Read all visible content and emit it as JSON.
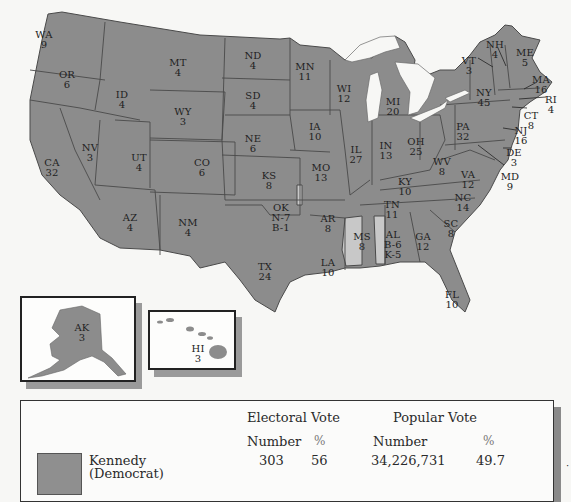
{
  "map": {
    "colors": {
      "kennedy": "#8c8c8c",
      "unpledged_byrd": "#c8c8c8",
      "border": "#4a4a4a",
      "water": "#f7f7f5"
    },
    "states": [
      {
        "abbr": "WA",
        "ev": "9",
        "x": 44,
        "y": 30
      },
      {
        "abbr": "OR",
        "ev": "6",
        "x": 67,
        "y": 70
      },
      {
        "abbr": "CA",
        "ev": "32",
        "x": 52,
        "y": 158
      },
      {
        "abbr": "NV",
        "ev": "3",
        "x": 90,
        "y": 143
      },
      {
        "abbr": "ID",
        "ev": "4",
        "x": 122,
        "y": 90
      },
      {
        "abbr": "MT",
        "ev": "4",
        "x": 178,
        "y": 58
      },
      {
        "abbr": "WY",
        "ev": "3",
        "x": 183,
        "y": 107
      },
      {
        "abbr": "UT",
        "ev": "4",
        "x": 139,
        "y": 153
      },
      {
        "abbr": "CO",
        "ev": "6",
        "x": 202,
        "y": 158
      },
      {
        "abbr": "AZ",
        "ev": "4",
        "x": 130,
        "y": 213
      },
      {
        "abbr": "NM",
        "ev": "4",
        "x": 188,
        "y": 218
      },
      {
        "abbr": "ND",
        "ev": "4",
        "x": 253,
        "y": 51
      },
      {
        "abbr": "SD",
        "ev": "4",
        "x": 253,
        "y": 91
      },
      {
        "abbr": "NE",
        "ev": "6",
        "x": 253,
        "y": 134
      },
      {
        "abbr": "KS",
        "ev": "8",
        "x": 269,
        "y": 171
      },
      {
        "abbr": "OK",
        "ev": "N-7\nB-1",
        "x": 281,
        "y": 203
      },
      {
        "abbr": "TX",
        "ev": "24",
        "x": 265,
        "y": 262
      },
      {
        "abbr": "MN",
        "ev": "11",
        "x": 305,
        "y": 62
      },
      {
        "abbr": "IA",
        "ev": "10",
        "x": 315,
        "y": 122
      },
      {
        "abbr": "MO",
        "ev": "13",
        "x": 321,
        "y": 163
      },
      {
        "abbr": "AR",
        "ev": "8",
        "x": 328,
        "y": 214
      },
      {
        "abbr": "LA",
        "ev": "10",
        "x": 328,
        "y": 258
      },
      {
        "abbr": "WI",
        "ev": "12",
        "x": 344,
        "y": 84
      },
      {
        "abbr": "IL",
        "ev": "27",
        "x": 356,
        "y": 145
      },
      {
        "abbr": "MI",
        "ev": "20",
        "x": 393,
        "y": 97
      },
      {
        "abbr": "IN",
        "ev": "13",
        "x": 386,
        "y": 141
      },
      {
        "abbr": "OH",
        "ev": "25",
        "x": 416,
        "y": 137
      },
      {
        "abbr": "KY",
        "ev": "10",
        "x": 405,
        "y": 177
      },
      {
        "abbr": "TN",
        "ev": "11",
        "x": 392,
        "y": 200
      },
      {
        "abbr": "MS",
        "ev": "8",
        "x": 362,
        "y": 232
      },
      {
        "abbr": "AL",
        "ev": "B-6\nK-5",
        "x": 393,
        "y": 230
      },
      {
        "abbr": "GA",
        "ev": "12",
        "x": 423,
        "y": 232
      },
      {
        "abbr": "FL",
        "ev": "10",
        "x": 452,
        "y": 290
      },
      {
        "abbr": "SC",
        "ev": "8",
        "x": 451,
        "y": 219
      },
      {
        "abbr": "NC",
        "ev": "14",
        "x": 463,
        "y": 193
      },
      {
        "abbr": "VA",
        "ev": "12",
        "x": 468,
        "y": 170
      },
      {
        "abbr": "WV",
        "ev": "8",
        "x": 442,
        "y": 157
      },
      {
        "abbr": "PA",
        "ev": "32",
        "x": 463,
        "y": 122
      },
      {
        "abbr": "NY",
        "ev": "45",
        "x": 484,
        "y": 88
      },
      {
        "abbr": "VT",
        "ev": "3",
        "x": 469,
        "y": 56
      },
      {
        "abbr": "NH",
        "ev": "4",
        "x": 495,
        "y": 40
      },
      {
        "abbr": "ME",
        "ev": "5",
        "x": 525,
        "y": 48
      },
      {
        "abbr": "MA",
        "ev": "16",
        "x": 541,
        "y": 75
      },
      {
        "abbr": "RI",
        "ev": "4",
        "x": 551,
        "y": 95
      },
      {
        "abbr": "CT",
        "ev": "8",
        "x": 531,
        "y": 111
      },
      {
        "abbr": "NJ",
        "ev": "16",
        "x": 521,
        "y": 126
      },
      {
        "abbr": "DE",
        "ev": "3",
        "x": 514,
        "y": 148
      },
      {
        "abbr": "MD",
        "ev": "9",
        "x": 510,
        "y": 172
      },
      {
        "abbr": "AK",
        "ev": "3",
        "x": 82,
        "y": 323
      },
      {
        "abbr": "HI",
        "ev": "3",
        "x": 198,
        "y": 344
      }
    ]
  },
  "legend": {
    "electoral_header": "Electoral Vote",
    "popular_header": "Popular Vote",
    "col_number_1": "Number",
    "col_pct_1": "%",
    "col_number_2": "Number",
    "col_pct_2": "%",
    "rows": [
      {
        "candidate": "Kennedy",
        "party": "(Democrat)",
        "ev_number": "303",
        "ev_pct": "56",
        "pv_number": "34,226,731",
        "pv_pct": "49.7"
      }
    ]
  }
}
